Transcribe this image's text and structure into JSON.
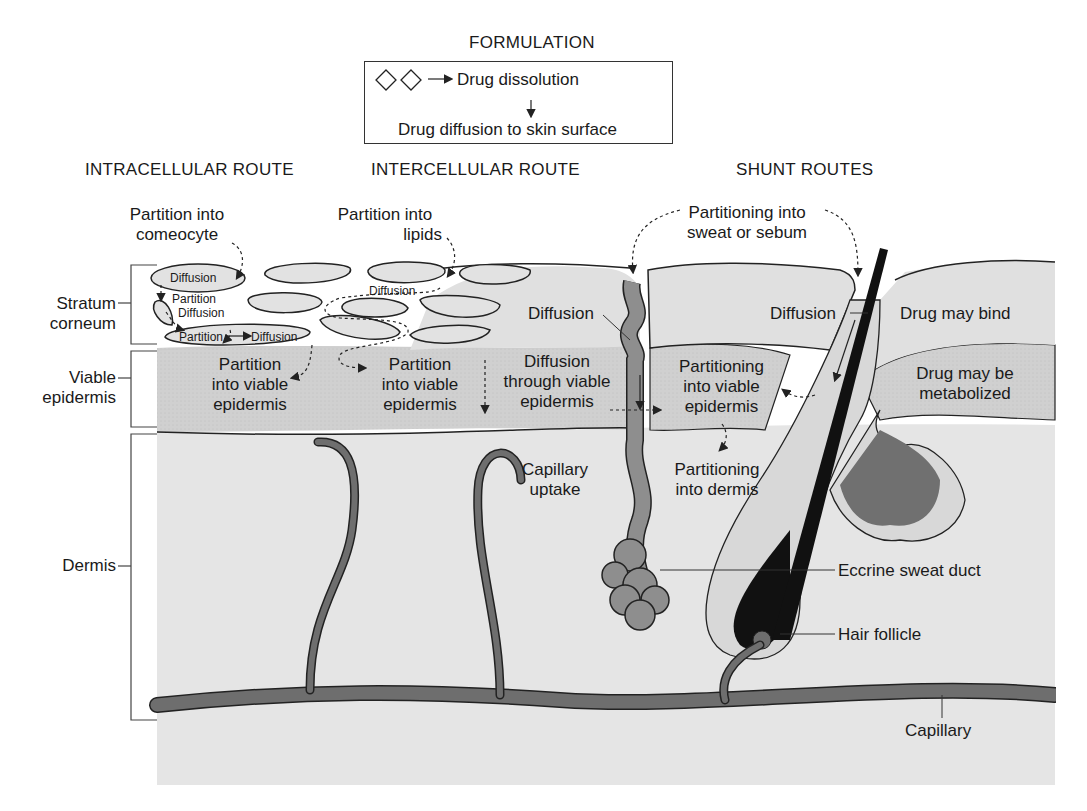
{
  "formulation": {
    "title": "FORMULATION",
    "step1": "Drug dissolution",
    "step2": "Drug diffusion to skin surface",
    "particle_icon": "diamond-icon"
  },
  "routes": {
    "intracellular": "INTRACELLULAR ROUTE",
    "intercellular": "INTERCELLULAR ROUTE",
    "shunt": "SHUNT ROUTES"
  },
  "layers": {
    "stratum_corneum": [
      "Stratum",
      "corneum"
    ],
    "viable_epidermis": [
      "Viable",
      "epidermis"
    ],
    "dermis": "Dermis"
  },
  "intracellular": {
    "partition_corneocyte": [
      "Partition into",
      "comeocyte"
    ],
    "diffusion_1": "Diffusion",
    "partition_1": "Partition",
    "diffusion_2": "Diffusion",
    "partition_2": "Partition",
    "diffusion_3": "Diffusion",
    "partition_viable": [
      "Partition",
      "into viable",
      "epidermis"
    ]
  },
  "intercellular": {
    "partition_lipids": [
      "Partition into",
      "lipids"
    ],
    "diffusion": "Diffusion",
    "partition_viable": [
      "Partition",
      "into viable",
      "epidermis"
    ]
  },
  "center": {
    "diffusion_sweat": "Diffusion",
    "diffusion_viable": [
      "Diffusion",
      "through viable",
      "epidermis"
    ],
    "capillary_uptake": [
      "Capillary",
      "uptake"
    ]
  },
  "shunt": {
    "partitioning_sweat_sebum": [
      "Partitioning into",
      "sweat or sebum"
    ],
    "diffusion": "Diffusion",
    "drug_may_bind": "Drug may bind",
    "partitioning_viable": [
      "Partitioning",
      "into viable",
      "epidermis"
    ],
    "drug_metabolized": [
      "Drug may be",
      "metabolized"
    ],
    "partitioning_dermis": [
      "Partitioning",
      "into dermis"
    ],
    "eccrine_sweat_duct": "Eccrine sweat duct",
    "hair_follicle": "Hair follicle",
    "capillary": "Capillary"
  },
  "colors": {
    "stratum": "#e2e2e2",
    "viable": "#cfcfcf",
    "dermis": "#e6e6e6",
    "vessel": "#6e6e6e",
    "gland": "#8c8c8c",
    "hair": "#111111",
    "outline": "#222222"
  }
}
